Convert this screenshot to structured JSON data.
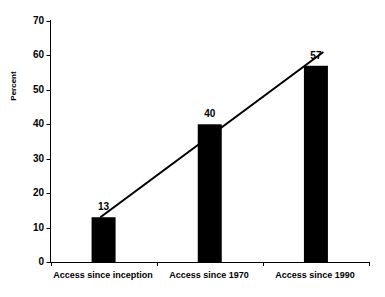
{
  "chart_data": {
    "type": "bar",
    "title": "",
    "subtitle": "",
    "xlabel": "",
    "ylabel": "Percent",
    "categories": [
      "Access since inception",
      "Access since 1970",
      "Access since 1990"
    ],
    "values": [
      13,
      40,
      57
    ],
    "value_labels": [
      "13",
      "40",
      "57"
    ],
    "ylim": [
      0,
      70
    ],
    "yticks": [
      0,
      10,
      20,
      30,
      40,
      50,
      60,
      70
    ],
    "ytick_labels": [
      "0",
      "10",
      "20",
      "30",
      "40",
      "50",
      "60",
      "70"
    ],
    "grid": false,
    "legend": "none",
    "bar_color": "#000000",
    "axis_color": "#000000",
    "background_color": "#ffffff",
    "series": [
      {
        "name": "Percent with access",
        "type": "bar",
        "values": [
          13,
          40,
          57
        ]
      },
      {
        "name": "Trend line",
        "type": "line",
        "x_start_category_fraction": 0.47,
        "x_end_category_fraction": 2.57,
        "y_start": 13,
        "y_end": 61,
        "color": "#000000"
      }
    ]
  },
  "axes": {
    "y_axis_name": "percent-axis",
    "x_axis_name": "category-axis"
  }
}
